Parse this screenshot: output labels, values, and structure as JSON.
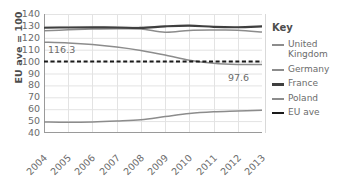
{
  "chart_data": {
    "type": "line",
    "title": "",
    "xlabel": "",
    "ylabel": "EU ave = 100",
    "x": [
      "2004",
      "2005",
      "2006",
      "2007",
      "2008",
      "2009",
      "2010",
      "2011",
      "2012",
      "2013"
    ],
    "ylim": [
      40,
      140
    ],
    "ytick_labels": [
      "140",
      "130",
      "120",
      "110",
      "100",
      "90",
      "80",
      "70",
      "60",
      "50",
      "40"
    ],
    "yticks": [
      140,
      130,
      120,
      110,
      100,
      90,
      80,
      70,
      60,
      50,
      40
    ],
    "grid": true,
    "legend_position": "right",
    "series": [
      {
        "name": "United Kingdom",
        "color": "#8c8c8c",
        "style": "solid",
        "values": [
          116.3,
          115.7,
          114.4,
          112.3,
          109.4,
          105.6,
          101.2,
          98.6,
          97.6,
          97.6
        ]
      },
      {
        "name": "Germany",
        "color": "#8c8c8c",
        "style": "solid",
        "values": [
          126.0,
          126.7,
          127.3,
          127.6,
          127.4,
          124.7,
          126.2,
          126.5,
          126.4,
          124.8
        ]
      },
      {
        "name": "France",
        "color": "#3f3f3f",
        "style": "solid",
        "values": [
          128.4,
          128.7,
          128.8,
          128.7,
          128.3,
          129.6,
          130.2,
          129.2,
          128.9,
          129.6
        ]
      },
      {
        "name": "Poland",
        "color": "#8c8c8c",
        "style": "solid",
        "values": [
          49.2,
          49.0,
          49.3,
          50.1,
          51.2,
          53.8,
          56.4,
          57.8,
          58.5,
          59.2
        ]
      },
      {
        "name": "EU ave",
        "color": "#1a1a1a",
        "style": "dashed",
        "values": [
          100,
          100,
          100,
          100,
          100,
          100,
          100,
          100,
          100,
          100
        ]
      }
    ],
    "annotations": [
      {
        "text": "116.3",
        "series": "United Kingdom",
        "x": "2004",
        "y": 116.3
      },
      {
        "text": "97.6",
        "series": "United Kingdom",
        "x": "2012",
        "y": 97.6
      }
    ]
  },
  "legend": {
    "title": "Key",
    "items": [
      {
        "label": "United Kingdom",
        "color": "#8c8c8c",
        "style": "solid"
      },
      {
        "label": "Germany",
        "color": "#8c8c8c",
        "style": "solid"
      },
      {
        "label": "France",
        "color": "#3f3f3f",
        "style": "solid"
      },
      {
        "label": "Poland",
        "color": "#8c8c8c",
        "style": "solid"
      },
      {
        "label": "EU ave",
        "color": "#1a1a1a",
        "style": "dashed"
      }
    ]
  },
  "colors": {
    "grid": "#e3e3e3",
    "axis": "#9a9a9a",
    "text": "#6b6b6b",
    "title_text": "#4d4d4d",
    "background": "#ffffff"
  }
}
